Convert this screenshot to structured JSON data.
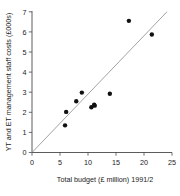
{
  "chart_data": {
    "type": "scatter",
    "title": "",
    "xlabel": "Total budget (£ million) 1991/2",
    "ylabel": "YT and ET management staff costs (£000s)",
    "xlim": [
      0,
      25
    ],
    "ylim": [
      0,
      7
    ],
    "xticks": [
      0,
      5,
      10,
      15,
      20,
      25
    ],
    "yticks": [
      0,
      1,
      2,
      3,
      4,
      5,
      6,
      7
    ],
    "xtick_labels": [
      "0",
      "5",
      "10",
      "15",
      "20",
      "25"
    ],
    "ytick_labels": [
      "0",
      "1",
      "2",
      "3",
      "4",
      "5",
      "6",
      "7"
    ],
    "grid": false,
    "legend": null,
    "marker": {
      "shape": "circle",
      "color": "#111111",
      "size": 3.2
    },
    "points": [
      {
        "x": 5.9,
        "y": 1.35
      },
      {
        "x": 6.1,
        "y": 2.02
      },
      {
        "x": 7.9,
        "y": 2.55
      },
      {
        "x": 8.9,
        "y": 2.98
      },
      {
        "x": 10.6,
        "y": 2.25
      },
      {
        "x": 11.1,
        "y": 2.38
      },
      {
        "x": 11.2,
        "y": 2.33
      },
      {
        "x": 13.9,
        "y": 2.92
      },
      {
        "x": 17.3,
        "y": 6.55
      },
      {
        "x": 21.4,
        "y": 5.87
      }
    ],
    "fit_line": {
      "type": "line",
      "through_origin": true,
      "x0": 0.0,
      "y0": 0.0,
      "x1": 24.1,
      "y1": 7.0,
      "color": "#8a8a8a"
    }
  },
  "axes": {
    "x_axis_name": "x-axis",
    "y_axis_name": "y-axis"
  }
}
